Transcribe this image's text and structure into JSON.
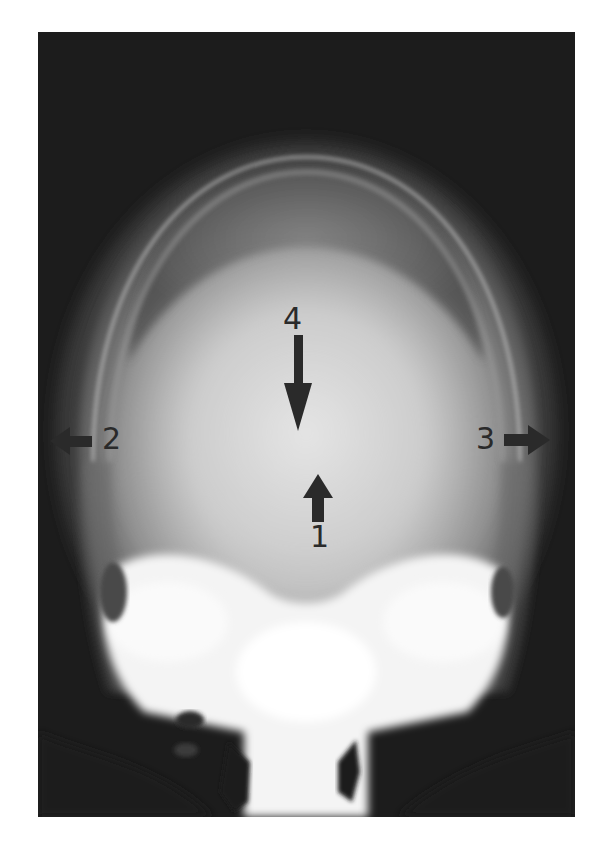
{
  "image": {
    "description": "Radiograph (X-ray) of skull, frontal/axial view, with four numbered arrow annotations",
    "background_color": "#1c1c1c",
    "bone_color": "#f4f4f4"
  },
  "annotations": [
    {
      "number": "1",
      "arrow_direction": "up",
      "x": 315,
      "y": 490
    },
    {
      "number": "2",
      "arrow_direction": "left",
      "x": 112,
      "y": 438
    },
    {
      "number": "3",
      "arrow_direction": "right",
      "x": 484,
      "y": 438
    },
    {
      "number": "4",
      "arrow_direction": "down",
      "x": 296,
      "y": 323
    }
  ]
}
